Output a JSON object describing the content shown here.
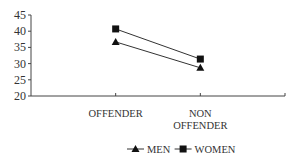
{
  "chart_data": {
    "type": "line",
    "title": "",
    "xlabel": "",
    "ylabel": "",
    "categories": [
      "OFFENDER",
      "NON OFFENDER"
    ],
    "category_lines": [
      [
        "OFFENDER"
      ],
      [
        "NON",
        "OFFENDER"
      ]
    ],
    "series": [
      {
        "name": "MEN",
        "marker": "triangle",
        "values": [
          36.7,
          28.7
        ]
      },
      {
        "name": "WOMEN",
        "marker": "square",
        "values": [
          40.7,
          31.4
        ]
      }
    ],
    "ylim": [
      20,
      45
    ],
    "yticks": [
      20,
      25,
      30,
      35,
      40,
      45
    ],
    "grid": false,
    "legend_position": "bottom",
    "colors": {
      "line": "#333333",
      "axis": "#444444"
    }
  }
}
